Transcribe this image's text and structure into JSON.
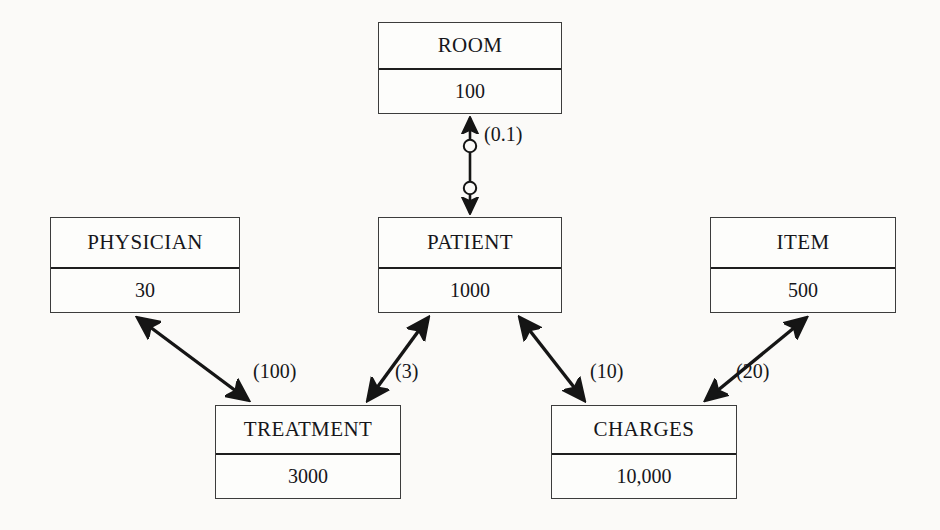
{
  "diagram": {
    "background_color": "#fbfaf8",
    "line_color": "#151515",
    "box_border_color": "#3c3c3c",
    "entities": [
      {
        "id": "room",
        "name": "ROOM",
        "count": "100"
      },
      {
        "id": "physician",
        "name": "PHYSICIAN",
        "count": "30"
      },
      {
        "id": "patient",
        "name": "PATIENT",
        "count": "1000"
      },
      {
        "id": "item",
        "name": "ITEM",
        "count": "500"
      },
      {
        "id": "treatment",
        "name": "TREATMENT",
        "count": "3000"
      },
      {
        "id": "charges",
        "name": "CHARGES",
        "count": "10,000"
      }
    ],
    "relationships": [
      {
        "id": "room-patient",
        "from": "ROOM",
        "to": "PATIENT",
        "label": "(0.1)",
        "arrows": "double",
        "optional_markers": 2
      },
      {
        "id": "physician-treatment",
        "from": "PHYSICIAN",
        "to": "TREATMENT",
        "label": "(100)",
        "arrows": "double",
        "optional_markers": 0
      },
      {
        "id": "patient-treatment",
        "from": "PATIENT",
        "to": "TREATMENT",
        "label": "(3)",
        "arrows": "double",
        "optional_markers": 0
      },
      {
        "id": "patient-charges",
        "from": "PATIENT",
        "to": "CHARGES",
        "label": "(10)",
        "arrows": "double",
        "optional_markers": 0
      },
      {
        "id": "item-charges",
        "from": "ITEM",
        "to": "CHARGES",
        "label": "(20)",
        "arrows": "double",
        "optional_markers": 0
      }
    ]
  }
}
